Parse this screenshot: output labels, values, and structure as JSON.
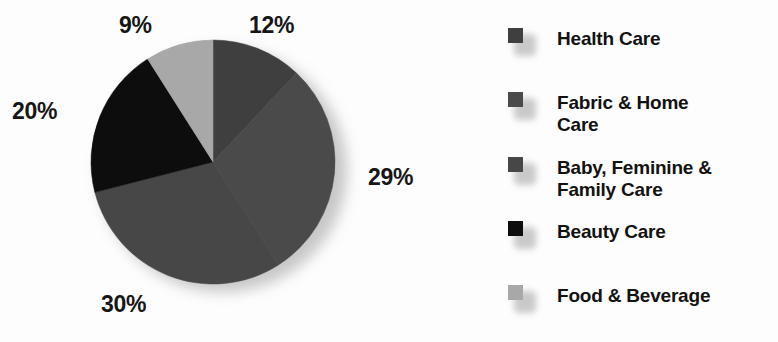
{
  "chart_data": {
    "type": "pie",
    "title": "",
    "subtitle": "",
    "xlabel": "",
    "ylabel": "",
    "grid": false,
    "legend_position": "right",
    "start_angle_deg": 0,
    "direction": "clockwise",
    "categories": [
      "Health Care",
      "Fabric & Home Care",
      "Baby, Feminine & Family Care",
      "Beauty Care",
      "Food & Beverage"
    ],
    "values": [
      12,
      29,
      30,
      20,
      9
    ],
    "value_labels": [
      "12%",
      "29%",
      "30%",
      "20%",
      "9%"
    ],
    "unit": "%",
    "colors": [
      "#3f3f3f",
      "#4a4a4a",
      "#474747",
      "#0d0d0d",
      "#a8a8a8"
    ],
    "slices": [
      {
        "label": "Health Care",
        "value": 12,
        "display": "12%",
        "color": "#3f3f3f",
        "start_deg": 0,
        "end_deg": 43.2
      },
      {
        "label": "Fabric & Home Care",
        "value": 29,
        "display": "29%",
        "color": "#4a4a4a",
        "start_deg": 43.2,
        "end_deg": 147.6
      },
      {
        "label": "Baby, Feminine & Family Care",
        "value": 30,
        "display": "30%",
        "color": "#474747",
        "start_deg": 147.6,
        "end_deg": 255.6
      },
      {
        "label": "Beauty Care",
        "value": 20,
        "display": "20%",
        "color": "#0d0d0d",
        "start_deg": 255.6,
        "end_deg": 327.6
      },
      {
        "label": "Food & Beverage",
        "value": 9,
        "display": "9%",
        "color": "#a8a8a8",
        "start_deg": 327.6,
        "end_deg": 360
      }
    ]
  },
  "pie": {
    "labels": {
      "pct_12": "12%",
      "pct_29": "29%",
      "pct_30": "30%",
      "pct_20": "20%",
      "pct_9": "9%"
    }
  },
  "legend": {
    "items": [
      {
        "label": "Health Care",
        "color": "#3f3f3f"
      },
      {
        "label": "Fabric & Home\nCare",
        "color": "#4a4a4a"
      },
      {
        "label": "Baby, Feminine &\nFamily Care",
        "color": "#474747"
      },
      {
        "label": "Beauty Care",
        "color": "#0d0d0d"
      },
      {
        "label": "Food & Beverage",
        "color": "#a8a8a8"
      }
    ]
  }
}
